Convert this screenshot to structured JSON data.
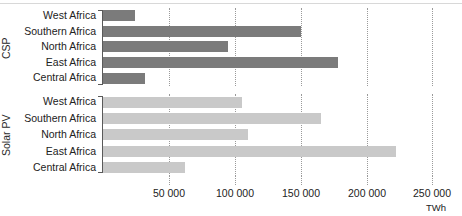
{
  "chart_data": {
    "type": "bar",
    "orientation": "horizontal",
    "title": "",
    "xlabel": "TWh",
    "ylabel": "",
    "unit": "TWh",
    "xlim": [
      0,
      260000
    ],
    "grid": true,
    "legend_position": "none",
    "ticks": [
      "50 000",
      "100 000",
      "150 000",
      "200 000",
      "250 000"
    ],
    "tick_values": [
      50000,
      100000,
      150000,
      200000,
      250000
    ],
    "categories": [
      "West Africa",
      "Southern Africa",
      "North Africa",
      "East Africa",
      "Central Africa"
    ],
    "panels": [
      {
        "name": "CSP",
        "color": "#7b7b7b",
        "categories": [
          "West Africa",
          "Southern Africa",
          "North Africa",
          "East Africa",
          "Central Africa"
        ],
        "values": [
          24000,
          150000,
          95000,
          178000,
          32000
        ]
      },
      {
        "name": "Solar PV",
        "color": "#c9c9c9",
        "categories": [
          "West Africa",
          "Southern Africa",
          "North Africa",
          "East Africa",
          "Central Africa"
        ],
        "values": [
          105000,
          165000,
          110000,
          222000,
          62000
        ]
      }
    ],
    "series": [
      {
        "name": "CSP",
        "values": [
          24000,
          150000,
          95000,
          178000,
          32000
        ]
      },
      {
        "name": "Solar PV",
        "values": [
          105000,
          165000,
          110000,
          222000,
          62000
        ]
      }
    ]
  }
}
